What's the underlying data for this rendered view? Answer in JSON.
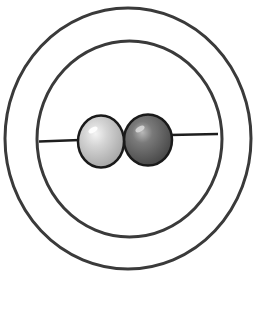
{
  "diagram": {
    "type": "electron-shell-model",
    "shells": 2,
    "particles": [
      {
        "name": "particle-light",
        "shade": "light-gray"
      },
      {
        "name": "particle-dark",
        "shade": "dark-gray"
      }
    ],
    "colors": {
      "stroke": "#3a3a3a",
      "wire": "#1e1e1e",
      "light_particle": "#c8c8c8",
      "dark_particle": "#6e6e6e",
      "background": "#ffffff"
    }
  }
}
